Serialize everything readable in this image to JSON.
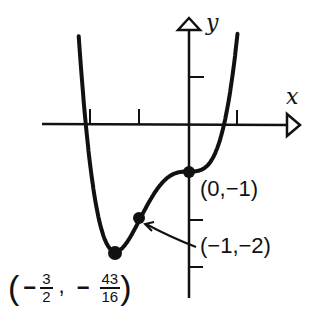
{
  "chart_data": {
    "type": "line",
    "title": "",
    "function": "y = x^4 + 2x^3 - 1",
    "xlabel": "x",
    "ylabel": "y",
    "x_ticks": [
      -2,
      -1,
      1
    ],
    "y_ticks": [
      1,
      -1,
      -2,
      -3
    ],
    "grid": false,
    "xlim": [
      -3,
      2
    ],
    "ylim": [
      -3.5,
      2.1
    ],
    "points": [
      {
        "x": 0,
        "y": -1,
        "label": "(0,−1)"
      },
      {
        "x": -1,
        "y": -2,
        "label": "(−1,−2)"
      },
      {
        "x": -1.5,
        "y": -2.6875,
        "label": "(−3/2, −43/16)"
      }
    ]
  },
  "labels": {
    "x_axis": "x",
    "y_axis": "y",
    "p1": "(0,−1)",
    "p2": "(−1,−2)",
    "p3_open": "(",
    "p3_minus1": "−",
    "p3_num1": "3",
    "p3_den1": "2",
    "p3_comma": ",",
    "p3_minus2": "−",
    "p3_num2": "43",
    "p3_den2": "16",
    "p3_close": ")"
  }
}
